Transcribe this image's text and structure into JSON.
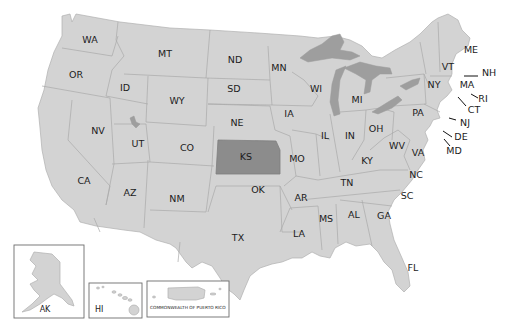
{
  "map": {
    "title": "United States map",
    "highlighted_state": "KS",
    "colors": {
      "land": "#d3d3d3",
      "highlight": "#8c8c8c",
      "lakes": "#9e9e9e",
      "borders": "#a9a9a9",
      "background": "#ffffff"
    },
    "state_labels": {
      "WA": "WA",
      "OR": "OR",
      "CA": "CA",
      "NV": "NV",
      "ID": "ID",
      "MT": "MT",
      "WY": "WY",
      "UT": "UT",
      "AZ": "AZ",
      "CO": "CO",
      "NM": "NM",
      "ND": "ND",
      "SD": "SD",
      "NE": "NE",
      "KS": "KS",
      "OK": "OK",
      "TX": "TX",
      "MN": "MN",
      "IA": "IA",
      "MO": "MO",
      "AR": "AR",
      "LA": "LA",
      "WI": "WI",
      "IL": "IL",
      "MI": "MI",
      "IN": "IN",
      "OH": "OH",
      "KY": "KY",
      "TN": "TN",
      "MS": "MS",
      "AL": "AL",
      "GA": "GA",
      "FL": "FL",
      "SC": "SC",
      "NC": "NC",
      "VA": "VA",
      "WV": "WV",
      "PA": "PA",
      "NY": "NY",
      "VT": "VT",
      "NH": "NH",
      "ME": "ME",
      "MA": "MA",
      "RI": "RI",
      "CT": "CT",
      "NJ": "NJ",
      "DE": "DE",
      "MD": "MD"
    },
    "insets": {
      "alaska": "AK",
      "hawaii": "HI",
      "puerto_rico": "COMMONWEALTH OF PUERTO RICO"
    }
  }
}
